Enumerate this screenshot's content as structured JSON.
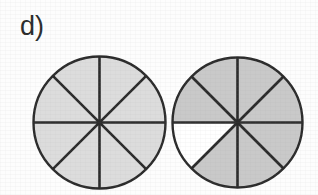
{
  "figure": {
    "label": "d)",
    "background_color": "#fdfdfd",
    "outline_color": "#2b2b2b",
    "divider_color": "#2b2b2b"
  },
  "chart_data": {
    "type": "pie",
    "title": "d)",
    "xlabel": "",
    "ylabel": "",
    "grid": false,
    "legend_position": "none",
    "charts": [
      {
        "name": "left-pie",
        "slices_total": 8,
        "slices_shaded": 8,
        "fraction": "8/8",
        "value": 1.0,
        "shaded_color": "#dcdcdc",
        "unshaded_color": "#ffffff",
        "center_x": 99,
        "center_y": 122,
        "radius": 66,
        "slice_angle_deg": 45,
        "slices": [
          {
            "index": 1,
            "start_deg": 0,
            "end_deg": 45,
            "shaded": true
          },
          {
            "index": 2,
            "start_deg": 45,
            "end_deg": 90,
            "shaded": true
          },
          {
            "index": 3,
            "start_deg": 90,
            "end_deg": 135,
            "shaded": true
          },
          {
            "index": 4,
            "start_deg": 135,
            "end_deg": 180,
            "shaded": true
          },
          {
            "index": 5,
            "start_deg": 180,
            "end_deg": 225,
            "shaded": true
          },
          {
            "index": 6,
            "start_deg": 225,
            "end_deg": 270,
            "shaded": true
          },
          {
            "index": 7,
            "start_deg": 270,
            "end_deg": 315,
            "shaded": true
          },
          {
            "index": 8,
            "start_deg": 315,
            "end_deg": 360,
            "shaded": true
          }
        ]
      },
      {
        "name": "right-pie",
        "slices_total": 8,
        "slices_shaded": 7,
        "fraction": "7/8",
        "value": 0.875,
        "shaded_color": "#c9c9c9",
        "unshaded_color": "#ffffff",
        "center_x": 237,
        "center_y": 122,
        "radius": 65,
        "slice_angle_deg": 45,
        "slices": [
          {
            "index": 1,
            "start_deg": 0,
            "end_deg": 45,
            "shaded": true
          },
          {
            "index": 2,
            "start_deg": 45,
            "end_deg": 90,
            "shaded": true
          },
          {
            "index": 3,
            "start_deg": 90,
            "end_deg": 135,
            "shaded": true
          },
          {
            "index": 4,
            "start_deg": 135,
            "end_deg": 180,
            "shaded": true
          },
          {
            "index": 5,
            "start_deg": 180,
            "end_deg": 225,
            "shaded": false
          },
          {
            "index": 6,
            "start_deg": 225,
            "end_deg": 270,
            "shaded": true
          },
          {
            "index": 7,
            "start_deg": 270,
            "end_deg": 315,
            "shaded": true
          },
          {
            "index": 8,
            "start_deg": 315,
            "end_deg": 360,
            "shaded": true
          }
        ]
      }
    ]
  }
}
